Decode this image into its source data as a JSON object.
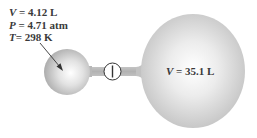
{
  "small_bulb": {
    "volume_symbol": "V",
    "volume_value": " = 4.12 L",
    "pressure_symbol": "P",
    "pressure_value": " = 4.71 atm",
    "temperature_symbol": "T",
    "temperature_value": "= 298 K"
  },
  "large_bulb": {
    "volume_symbol": "V",
    "volume_value": " = 35.1 L"
  },
  "valve": {
    "state": "closed"
  },
  "colors": {
    "bulb_highlight": "#ffffff",
    "bulb_shadow": "#b5b5b5",
    "tube": "#b9b9b9",
    "text": "#3a3a3a",
    "valve_stroke": "#333333"
  }
}
